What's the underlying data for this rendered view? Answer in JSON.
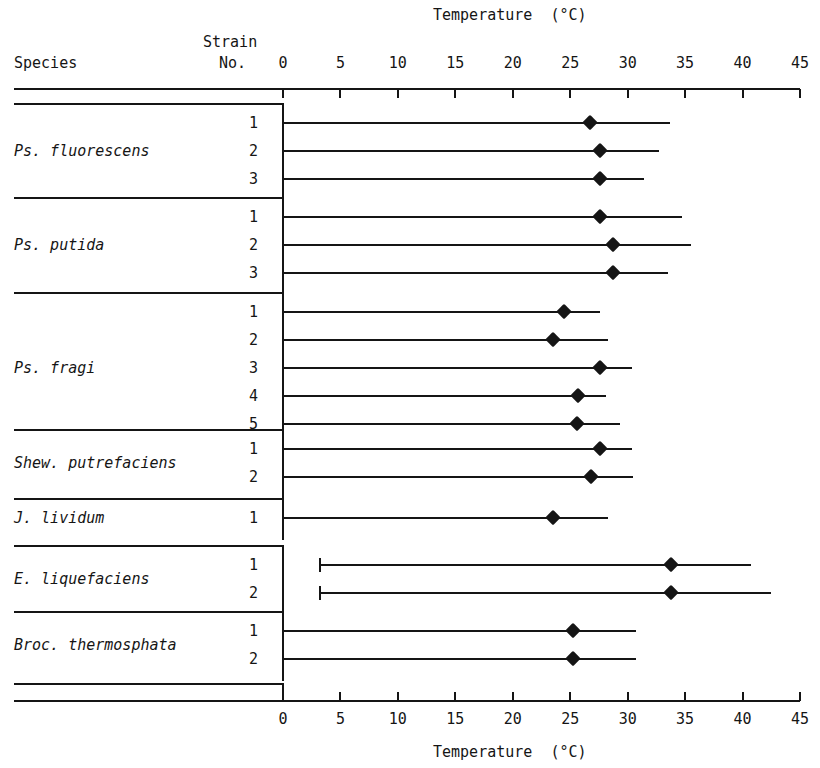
{
  "header": {
    "top_axis_title": "Temperature  (°C)",
    "bottom_axis_title": "Temperature  (°C)",
    "species_column_header": "Species",
    "strain_column_header_line1": "Strain",
    "strain_column_header_line2": "No."
  },
  "chart_data": {
    "type": "range",
    "title": "Temperature  (°C)",
    "xlabel": "Temperature  (°C)",
    "ylabel": "Species",
    "xlim": [
      0,
      45
    ],
    "xticks": [
      0,
      5,
      10,
      15,
      20,
      25,
      30,
      35,
      40,
      45
    ],
    "xtick_labels": [
      "0",
      "5",
      "10",
      "15",
      "20",
      "25",
      "30",
      "35",
      "40",
      "45"
    ],
    "grid": false,
    "legend": "none",
    "marker_meaning": "optimum temperature",
    "line_meaning": "growth temperature range (min to max)",
    "groups": [
      {
        "species": "Ps. fluorescens",
        "strains": [
          {
            "no": "1",
            "min": 0,
            "optimum": 26.7,
            "max": 33.7
          },
          {
            "no": "2",
            "min": 0,
            "optimum": 27.6,
            "max": 32.7
          },
          {
            "no": "3",
            "min": 0,
            "optimum": 27.6,
            "max": 31.4
          }
        ]
      },
      {
        "species": "Ps. putida",
        "strains": [
          {
            "no": "1",
            "min": 0,
            "optimum": 27.6,
            "max": 34.7
          },
          {
            "no": "2",
            "min": 0,
            "optimum": 28.7,
            "max": 35.5
          },
          {
            "no": "3",
            "min": 0,
            "optimum": 28.7,
            "max": 33.5
          }
        ]
      },
      {
        "species": "Ps. fragi",
        "strains": [
          {
            "no": "1",
            "min": 0,
            "optimum": 24.5,
            "max": 27.6
          },
          {
            "no": "2",
            "min": 0,
            "optimum": 23.5,
            "max": 28.3
          },
          {
            "no": "3",
            "min": 0,
            "optimum": 27.6,
            "max": 30.4
          },
          {
            "no": "4",
            "min": 0,
            "optimum": 25.7,
            "max": 28.1
          },
          {
            "no": "5",
            "min": 0,
            "optimum": 25.6,
            "max": 29.3
          }
        ]
      },
      {
        "species": "Shew. putrefaciens",
        "strains": [
          {
            "no": "1",
            "min": 0,
            "optimum": 27.6,
            "max": 30.4
          },
          {
            "no": "2",
            "min": 0,
            "optimum": 26.8,
            "max": 30.5
          }
        ]
      },
      {
        "species": "J. lividum",
        "strains": [
          {
            "no": "1",
            "min": 0,
            "optimum": 23.5,
            "max": 28.3
          }
        ]
      },
      {
        "species": "E. liquefaciens",
        "strains": [
          {
            "no": "1",
            "min": 3.2,
            "optimum": 33.8,
            "max": 40.7
          },
          {
            "no": "2",
            "min": 3.2,
            "optimum": 33.8,
            "max": 42.5
          }
        ]
      },
      {
        "species": "Broc. thermosphata",
        "strains": [
          {
            "no": "1",
            "min": 0,
            "optimum": 25.2,
            "max": 30.7
          },
          {
            "no": "2",
            "min": 0,
            "optimum": 25.2,
            "max": 30.7
          }
        ]
      }
    ]
  },
  "style": {
    "ink": "#151515",
    "paper": "#ffffff"
  }
}
